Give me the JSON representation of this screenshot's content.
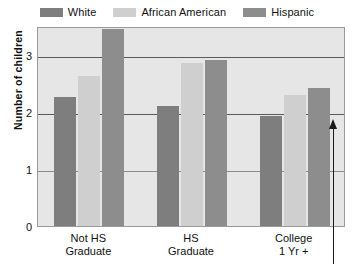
{
  "chart_data": {
    "type": "bar",
    "title": "",
    "xlabel": "",
    "ylabel": "Number of children",
    "ylim": [
      0,
      3.5
    ],
    "yticks": [
      0,
      1,
      2,
      3
    ],
    "ytick_labels": [
      "0",
      "1",
      "2",
      "3"
    ],
    "grid": true,
    "legend_position": "top",
    "categories": [
      "Not HS Graduate",
      "HS Graduate",
      "College 1 Yr +"
    ],
    "category_lines": [
      [
        "Not HS",
        "Graduate"
      ],
      [
        "HS",
        "Graduate"
      ],
      [
        "College",
        "1 Yr +"
      ]
    ],
    "series": [
      {
        "name": "White",
        "color": "#7e7e7e",
        "values": [
          2.25,
          2.1,
          1.93
        ]
      },
      {
        "name": "African American",
        "color": "#cfcfcf",
        "values": [
          2.63,
          2.85,
          2.3
        ]
      },
      {
        "name": "Hispanic",
        "color": "#8d8d8d",
        "values": [
          3.45,
          2.9,
          2.42
        ]
      }
    ],
    "annotations": [
      {
        "name": "replacement-level-arrow",
        "type": "arrow",
        "points_to_y": 2.0,
        "direction": "up"
      }
    ]
  },
  "colors": {
    "plot_background": "#e6e6e6",
    "plot_border": "#9a9a9a",
    "gridline": "#5a5a5a",
    "gridline_minor": "#8c8c8c",
    "annotation": "#1a1a1a",
    "text": "#111111"
  }
}
